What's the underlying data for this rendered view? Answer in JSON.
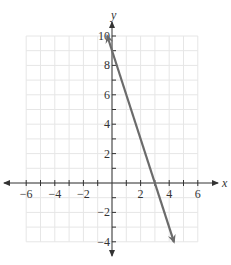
{
  "chart_data": {
    "type": "line",
    "title": "",
    "xlabel": "x",
    "ylabel": "y",
    "xlim": [
      -6,
      6
    ],
    "ylim": [
      -4,
      10
    ],
    "grid": true,
    "x_ticks": [
      -6,
      -4,
      -2,
      2,
      4,
      6
    ],
    "x_tick_labels": [
      "−6",
      "−4",
      "−2",
      "2",
      "4",
      "6"
    ],
    "y_ticks": [
      -4,
      -2,
      2,
      4,
      6,
      8,
      10
    ],
    "y_tick_labels": [
      "−4",
      "−2",
      "2",
      "4",
      "6",
      "8",
      "10"
    ],
    "series": [
      {
        "name": "line",
        "equation": "y = -3x + 9",
        "slope": -3,
        "intercept": 9,
        "x": [
          -0.33,
          4.33
        ],
        "y": [
          10,
          -4
        ],
        "arrows_both_ends": true,
        "color": "#6b6b6b"
      }
    ],
    "key_points": {
      "y_intercept": [
        0,
        9
      ],
      "x_intercept": [
        3,
        0
      ]
    }
  },
  "colors": {
    "grid": "#e6e6e6",
    "axis": "#333333",
    "line": "#6b6b6b"
  }
}
